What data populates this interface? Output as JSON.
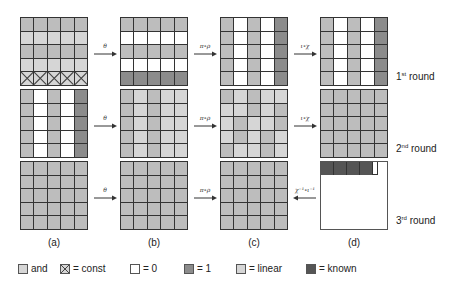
{
  "colors": {
    "and": "#bdbdbd",
    "const": "#d6d6d6",
    "zero": "#ffffff",
    "one": "#8c8c8c",
    "linear": "#d6d6d6",
    "known": "#555555"
  },
  "columns": [
    {
      "label": "(a)"
    },
    {
      "label": "(b)"
    },
    {
      "label": "(c)"
    },
    {
      "label": "(d)"
    }
  ],
  "rounds": [
    {
      "label": "1",
      "suffix": "st",
      "word": "round",
      "arrows": [
        {
          "label": "θ",
          "direction": "right"
        },
        {
          "label": "π∘ρ",
          "direction": "right"
        },
        {
          "label": "ι∘χ",
          "direction": "right"
        }
      ],
      "grids": [
        [
          [
            "and",
            "and",
            "and",
            "and",
            "and"
          ],
          [
            "linear",
            "linear",
            "linear",
            "linear",
            "linear"
          ],
          [
            "and",
            "and",
            "and",
            "and",
            "and"
          ],
          [
            "linear",
            "linear",
            "linear",
            "linear",
            "linear"
          ],
          [
            "const",
            "const",
            "const",
            "const",
            "const"
          ]
        ],
        [
          [
            "and",
            "and",
            "and",
            "and",
            "and"
          ],
          [
            "zero",
            "zero",
            "zero",
            "zero",
            "zero"
          ],
          [
            "and",
            "and",
            "and",
            "and",
            "and"
          ],
          [
            "zero",
            "zero",
            "zero",
            "zero",
            "zero"
          ],
          [
            "one",
            "one",
            "one",
            "one",
            "one"
          ]
        ],
        [
          [
            "and",
            "zero",
            "and",
            "zero",
            "one"
          ],
          [
            "and",
            "zero",
            "and",
            "zero",
            "one"
          ],
          [
            "and",
            "zero",
            "and",
            "zero",
            "one"
          ],
          [
            "and",
            "zero",
            "and",
            "zero",
            "one"
          ],
          [
            "and",
            "zero",
            "and",
            "zero",
            "one"
          ]
        ],
        [
          [
            "and",
            "zero",
            "and",
            "zero",
            "one"
          ],
          [
            "and",
            "zero",
            "and",
            "zero",
            "one"
          ],
          [
            "and",
            "zero",
            "and",
            "zero",
            "one"
          ],
          [
            "and",
            "zero",
            "and",
            "zero",
            "one"
          ],
          [
            "and",
            "zero",
            "and",
            "zero",
            "one"
          ]
        ]
      ]
    },
    {
      "label": "2",
      "suffix": "nd",
      "word": "round",
      "arrows": [
        {
          "label": "θ",
          "direction": "right"
        },
        {
          "label": "π∘ρ",
          "direction": "right"
        },
        {
          "label": "ι∘χ",
          "direction": "right"
        }
      ],
      "grids": [
        [
          [
            "and",
            "zero",
            "and",
            "zero",
            "one"
          ],
          [
            "and",
            "zero",
            "and",
            "zero",
            "one"
          ],
          [
            "and",
            "zero",
            "and",
            "zero",
            "one"
          ],
          [
            "and",
            "zero",
            "and",
            "zero",
            "one"
          ],
          [
            "and",
            "zero",
            "and",
            "zero",
            "one"
          ]
        ],
        [
          [
            "and",
            "linear",
            "and",
            "linear",
            "linear"
          ],
          [
            "and",
            "linear",
            "and",
            "linear",
            "linear"
          ],
          [
            "and",
            "linear",
            "and",
            "linear",
            "linear"
          ],
          [
            "and",
            "linear",
            "and",
            "linear",
            "linear"
          ],
          [
            "and",
            "linear",
            "and",
            "linear",
            "linear"
          ]
        ],
        [
          [
            "and",
            "linear",
            "and",
            "linear",
            "linear"
          ],
          [
            "linear",
            "linear",
            "and",
            "linear",
            "and"
          ],
          [
            "linear",
            "and",
            "linear",
            "linear",
            "and"
          ],
          [
            "linear",
            "and",
            "linear",
            "and",
            "linear"
          ],
          [
            "and",
            "linear",
            "linear",
            "and",
            "linear"
          ]
        ],
        [
          [
            "and",
            "and",
            "and",
            "and",
            "and"
          ],
          [
            "and",
            "and",
            "and",
            "and",
            "and"
          ],
          [
            "and",
            "and",
            "and",
            "and",
            "and"
          ],
          [
            "and",
            "and",
            "and",
            "and",
            "and"
          ],
          [
            "and",
            "and",
            "and",
            "and",
            "and"
          ]
        ]
      ]
    },
    {
      "label": "3",
      "suffix": "rd",
      "word": "round",
      "arrows": [
        {
          "label": "θ",
          "direction": "right"
        },
        {
          "label": "π∘ρ",
          "direction": "right"
        },
        {
          "label": "χ⁻¹∘ι⁻¹",
          "direction": "left"
        }
      ],
      "grids": [
        [
          [
            "and",
            "and",
            "and",
            "and",
            "and"
          ],
          [
            "and",
            "and",
            "and",
            "and",
            "and"
          ],
          [
            "and",
            "and",
            "and",
            "and",
            "and"
          ],
          [
            "and",
            "and",
            "and",
            "and",
            "and"
          ],
          [
            "and",
            "and",
            "and",
            "and",
            "and"
          ]
        ],
        [
          [
            "and",
            "and",
            "and",
            "and",
            "and"
          ],
          [
            "and",
            "and",
            "and",
            "and",
            "and"
          ],
          [
            "and",
            "and",
            "and",
            "and",
            "and"
          ],
          [
            "and",
            "and",
            "and",
            "and",
            "and"
          ],
          [
            "and",
            "and",
            "and",
            "and",
            "and"
          ]
        ],
        [
          [
            "and",
            "and",
            "and",
            "and",
            "and"
          ],
          [
            "and",
            "and",
            "and",
            "and",
            "and"
          ],
          [
            "and",
            "and",
            "and",
            "and",
            "and"
          ],
          [
            "and",
            "and",
            "and",
            "and",
            "and"
          ],
          [
            "and",
            "and",
            "and",
            "and",
            "and"
          ]
        ],
        "partial"
      ],
      "partial_known_cells": 4
    }
  ],
  "legend": [
    {
      "swatch": "and",
      "label": "and"
    },
    {
      "swatch": "const",
      "label": "= const"
    },
    {
      "swatch": "zero",
      "label": "= 0"
    },
    {
      "swatch": "one",
      "label": "= 1"
    },
    {
      "swatch": "linear",
      "label": "= linear"
    },
    {
      "swatch": "known",
      "label": "= known"
    }
  ]
}
